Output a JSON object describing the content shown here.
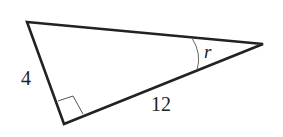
{
  "figure": {
    "type": "right-triangle",
    "labels": {
      "short_leg": "4",
      "long_leg": "12",
      "angle": "r"
    },
    "colors": {
      "stroke": "#222222",
      "angle_arc": "#666666",
      "background": "#ffffff"
    }
  }
}
